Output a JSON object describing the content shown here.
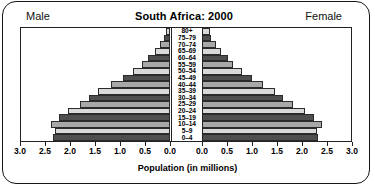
{
  "header": {
    "left_label": "Male",
    "right_label": "Female",
    "title": "South Africa: 2000"
  },
  "axis": {
    "x_title": "Population (in millions)",
    "left_ticks": [
      "3.0",
      "2.5",
      "2.0",
      "1.5",
      "1.0",
      "0.5",
      "0.0"
    ],
    "right_ticks": [
      "0.0",
      "0.5",
      "1.0",
      "1.5",
      "2.0",
      "2.5",
      "3.0"
    ]
  },
  "colors": {
    "bar_dark": "#4f4f4f",
    "bar_light": "#d9d9d9",
    "bar_mid": "#a8a8a8",
    "outline": "#2b2b2b",
    "frame": "#222222",
    "background": "#ffffff"
  },
  "chart_data": {
    "type": "bar",
    "title": "South Africa: 2000",
    "subtitle": "",
    "xlabel": "Population (in millions)",
    "ylabel": "",
    "xlim": [
      0,
      3.0
    ],
    "grid": false,
    "legend_position": "top",
    "categories": [
      "0-4",
      "5-9",
      "10-14",
      "15-19",
      "20-24",
      "25-29",
      "30-34",
      "35-39",
      "40-44",
      "45-49",
      "50-54",
      "55-59",
      "60-64",
      "65-69",
      "70-74",
      "75-79",
      "80+"
    ],
    "series": [
      {
        "name": "Male",
        "values": [
          2.35,
          2.3,
          2.38,
          2.22,
          2.05,
          1.8,
          1.62,
          1.45,
          1.18,
          0.95,
          0.74,
          0.56,
          0.44,
          0.3,
          0.2,
          0.12,
          0.09
        ]
      },
      {
        "name": "Female",
        "values": [
          2.32,
          2.3,
          2.4,
          2.24,
          2.05,
          1.82,
          1.62,
          1.45,
          1.22,
          1.0,
          0.8,
          0.62,
          0.52,
          0.38,
          0.27,
          0.17,
          0.15
        ]
      }
    ]
  }
}
